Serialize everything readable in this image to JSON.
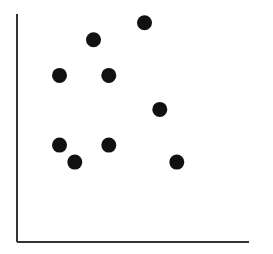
{
  "chart_data": {
    "type": "scatter",
    "title": "",
    "xlabel": "",
    "ylabel": "",
    "xlim": [
      0,
      13.6
    ],
    "ylim": [
      0,
      13.4
    ],
    "grid": false,
    "legend": null,
    "series": [
      {
        "name": "points",
        "color": "#111111",
        "points": [
          {
            "x": 7.5,
            "y": 12.9
          },
          {
            "x": 4.5,
            "y": 11.9
          },
          {
            "x": 2.5,
            "y": 9.8
          },
          {
            "x": 5.4,
            "y": 9.8
          },
          {
            "x": 8.4,
            "y": 7.8
          },
          {
            "x": 2.5,
            "y": 5.7
          },
          {
            "x": 5.4,
            "y": 5.7
          },
          {
            "x": 3.4,
            "y": 4.7
          },
          {
            "x": 9.4,
            "y": 4.7
          }
        ]
      }
    ]
  },
  "style": {
    "axis_color": "#333333",
    "background": "#ffffff",
    "marker_radius": 7.5
  }
}
